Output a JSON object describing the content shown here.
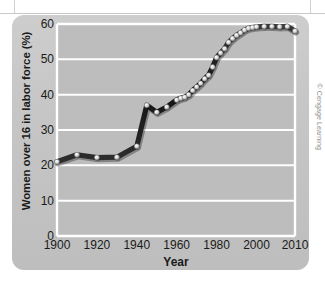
{
  "figure": {
    "credit": "© Cengage Learning",
    "panel_color": "#c4c4c4",
    "plot_color": "#bdbdbd",
    "gridline_color": "#ffffff",
    "line_color": "#1c1c1c",
    "marker_color": "#d8d8d8"
  },
  "chart_data": {
    "type": "line",
    "title": "",
    "xlabel": "Year",
    "ylabel": "Women over 16 in labor force (%)",
    "xlim": [
      1900,
      2010
    ],
    "ylim": [
      0,
      60
    ],
    "xticks": [
      1900,
      1920,
      1940,
      1960,
      1980,
      2000,
      2010
    ],
    "xticklabels": [
      "1900",
      "1920",
      "1940",
      "1960",
      "1980",
      "2000",
      "2010"
    ],
    "yticks": [
      0,
      10,
      20,
      30,
      40,
      50,
      60
    ],
    "yticklabels": [
      "0",
      "10",
      "20",
      "30",
      "40",
      "50",
      "60"
    ],
    "grid": "horizontal",
    "legend": "none",
    "series": [
      {
        "name": "Women over 16 in labor force",
        "x": [
          1900,
          1910,
          1920,
          1930,
          1940,
          1945,
          1950,
          1955,
          1960,
          1962,
          1964,
          1966,
          1968,
          1970,
          1972,
          1974,
          1976,
          1978,
          1980,
          1982,
          1984,
          1986,
          1988,
          1990,
          1992,
          1994,
          1996,
          1998,
          2000,
          2002,
          2004,
          2006,
          2008,
          2010
        ],
        "values": [
          21.0,
          23.0,
          22.2,
          22.3,
          25.4,
          37.0,
          35.0,
          36.5,
          38.5,
          39.0,
          39.3,
          40.0,
          41.2,
          42.2,
          43.2,
          44.5,
          45.5,
          47.8,
          50.5,
          51.8,
          53.0,
          54.8,
          55.9,
          56.8,
          57.5,
          58.3,
          58.8,
          59.0,
          59.2,
          59.3,
          59.3,
          59.2,
          59.3,
          58.0
        ]
      }
    ]
  }
}
